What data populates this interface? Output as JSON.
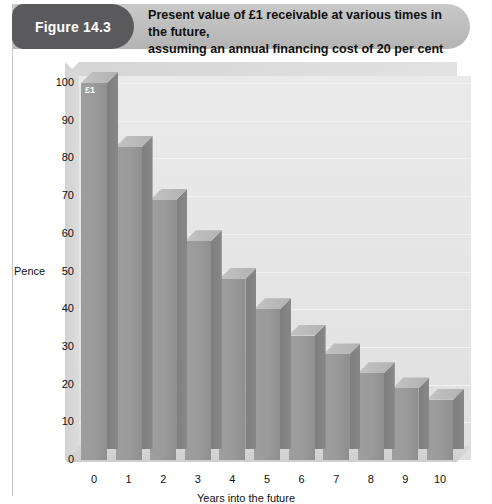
{
  "figure": {
    "badge": "Figure 14.3",
    "title_line1": "Present value of £1 receivable at various times in the future,",
    "title_line2": "assuming an annual financing cost of 20 per cent"
  },
  "colors": {
    "badge_background": "#5a5a5c",
    "banner_background": "#bdbdbd",
    "bar_front": "#9a9a9a",
    "bar_side": "#808080",
    "bar_top": "#bcbcbc",
    "plot_background": "#e6e6e6",
    "text": "#111111"
  },
  "chart_data": {
    "type": "bar",
    "title": "Present value of £1 receivable at various times in the future, assuming an annual financing cost of 20 per cent",
    "xlabel": "Years into the future",
    "ylabel": "Pence",
    "categories": [
      "0",
      "1",
      "2",
      "3",
      "4",
      "5",
      "6",
      "7",
      "8",
      "9",
      "10"
    ],
    "values": [
      100,
      83,
      69,
      58,
      48,
      40,
      33,
      28,
      23,
      19,
      16
    ],
    "ylim": [
      0,
      100
    ],
    "yticks": [
      "0",
      "10",
      "20",
      "30",
      "40",
      "50",
      "60",
      "70",
      "80",
      "90",
      "100"
    ],
    "xticks": [
      "0",
      "1",
      "2",
      "3",
      "4",
      "5",
      "6",
      "7",
      "8",
      "9",
      "10"
    ],
    "grid": true,
    "legend": "none",
    "annotations": [
      {
        "series_index": 0,
        "text": "£1"
      }
    ]
  }
}
